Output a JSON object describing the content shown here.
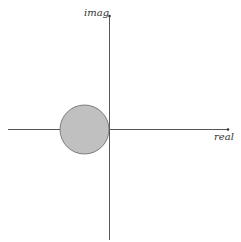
{
  "diagram": {
    "type": "complex-plane",
    "axes": {
      "x_label": "real",
      "y_label": "imag",
      "color": "#555555"
    },
    "shape": {
      "kind": "circle",
      "description": "disk in left half-plane tangent to imaginary axis",
      "fill": "#c0c0c0",
      "stroke": "#666666",
      "cx": 84.5,
      "cy": 129.5,
      "r": 24.5
    }
  }
}
